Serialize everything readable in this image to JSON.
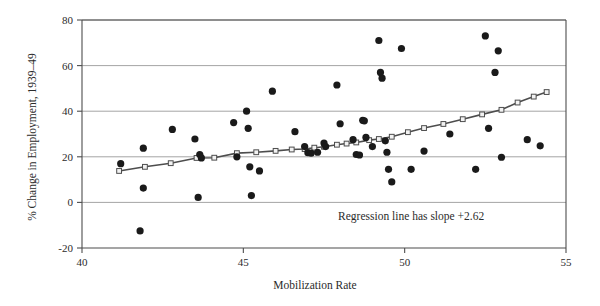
{
  "chart_data": {
    "type": "scatter",
    "title": "",
    "xlabel": "Mobilization Rate",
    "ylabel": "% Change in Employment, 1939–49",
    "xlim": [
      40,
      55
    ],
    "ylim": [
      -20,
      80
    ],
    "xticks": [
      40,
      45,
      50,
      55
    ],
    "yticks": [
      -20,
      0,
      20,
      40,
      60,
      80
    ],
    "xtick_labels": [
      "40",
      "45",
      "50",
      "55"
    ],
    "ytick_labels": [
      "-20",
      "0",
      "20",
      "40",
      "60",
      "80"
    ],
    "grid": "horizontal",
    "legend": "none",
    "annotations": [
      {
        "text": "Regression line has slope +2.62",
        "x": 50.2,
        "y": -7.5
      }
    ],
    "series": [
      {
        "name": "observations",
        "marker": "filled-circle",
        "color": "#1a1a1a",
        "points": [
          [
            41.2,
            17.0
          ],
          [
            41.9,
            23.8
          ],
          [
            41.9,
            6.3
          ],
          [
            41.8,
            -12.5
          ],
          [
            42.8,
            32.0
          ],
          [
            43.5,
            27.8
          ],
          [
            43.6,
            2.2
          ],
          [
            43.65,
            21.0
          ],
          [
            43.7,
            19.5
          ],
          [
            44.7,
            35.0
          ],
          [
            44.8,
            20.0
          ],
          [
            45.1,
            40.0
          ],
          [
            45.15,
            32.5
          ],
          [
            45.2,
            15.6
          ],
          [
            45.25,
            3.0
          ],
          [
            45.5,
            13.8
          ],
          [
            45.9,
            48.8
          ],
          [
            46.6,
            31.0
          ],
          [
            46.9,
            24.5
          ],
          [
            47.0,
            21.8
          ],
          [
            47.1,
            21.6
          ],
          [
            47.3,
            22.0
          ],
          [
            47.5,
            26.0
          ],
          [
            47.55,
            24.5
          ],
          [
            47.9,
            51.5
          ],
          [
            48.0,
            34.5
          ],
          [
            48.4,
            27.5
          ],
          [
            48.5,
            21.0
          ],
          [
            48.6,
            20.8
          ],
          [
            48.7,
            36.0
          ],
          [
            48.75,
            35.8
          ],
          [
            48.8,
            28.5
          ],
          [
            49.0,
            24.5
          ],
          [
            49.2,
            71.0
          ],
          [
            49.25,
            57.0
          ],
          [
            49.3,
            54.5
          ],
          [
            49.4,
            27.0
          ],
          [
            49.45,
            22.0
          ],
          [
            49.5,
            14.5
          ],
          [
            49.6,
            9.0
          ],
          [
            49.9,
            67.5
          ],
          [
            50.2,
            14.5
          ],
          [
            50.6,
            22.5
          ],
          [
            51.4,
            30.0
          ],
          [
            52.2,
            14.5
          ],
          [
            52.5,
            73.0
          ],
          [
            52.6,
            32.5
          ],
          [
            52.8,
            57.0
          ],
          [
            52.9,
            66.5
          ],
          [
            53.0,
            19.8
          ],
          [
            53.8,
            27.5
          ],
          [
            54.2,
            24.8
          ]
        ]
      },
      {
        "name": "regression-line",
        "marker": "open-square",
        "color": "#4d4d4d",
        "slope": 2.62,
        "points": [
          [
            41.15,
            13.8
          ],
          [
            41.95,
            15.6
          ],
          [
            42.75,
            17.2
          ],
          [
            43.55,
            19.5
          ],
          [
            44.1,
            19.6
          ],
          [
            44.8,
            21.6
          ],
          [
            45.4,
            22.0
          ],
          [
            46.0,
            22.6
          ],
          [
            46.5,
            23.2
          ],
          [
            46.9,
            23.4
          ],
          [
            47.2,
            24.0
          ],
          [
            47.5,
            24.4
          ],
          [
            47.9,
            25.3
          ],
          [
            48.2,
            25.8
          ],
          [
            48.5,
            26.3
          ],
          [
            48.9,
            27.3
          ],
          [
            49.2,
            27.8
          ],
          [
            49.6,
            28.8
          ],
          [
            50.1,
            30.8
          ],
          [
            50.6,
            32.6
          ],
          [
            51.2,
            34.4
          ],
          [
            51.8,
            36.5
          ],
          [
            52.4,
            38.6
          ],
          [
            53.0,
            40.6
          ],
          [
            53.5,
            43.8
          ],
          [
            54.0,
            46.4
          ],
          [
            54.4,
            48.4
          ]
        ]
      }
    ]
  },
  "figure": {
    "frame_color": "#4d4d4d",
    "gridline_color": "#9a9a9a",
    "background": "#ffffff"
  }
}
